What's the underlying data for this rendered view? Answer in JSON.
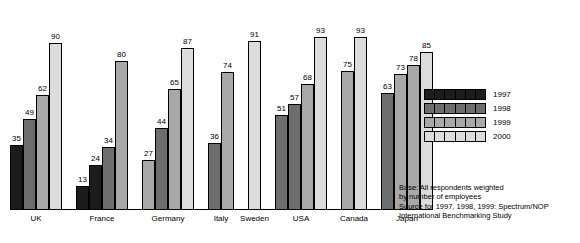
{
  "chart_data": {
    "type": "bar",
    "title": "",
    "xlabel": "",
    "ylabel": "",
    "ylim": [
      0,
      100
    ],
    "grid": false,
    "legend_position": "right",
    "categories": [
      "UK",
      "France",
      "Germany",
      "Italy",
      "Sweden",
      "USA",
      "Canada",
      "Japan"
    ],
    "series": [
      {
        "name": "1997",
        "color": "#1c1c1c",
        "values": [
          35,
          13,
          null,
          null,
          null,
          51,
          null,
          null
        ]
      },
      {
        "name": "1998",
        "color": "#6e6e6e",
        "values": [
          49,
          24,
          27,
          null,
          null,
          57,
          null,
          63
        ]
      },
      {
        "name": "1999",
        "color": "#a8a8a8",
        "values": [
          62,
          34,
          44,
          36,
          null,
          68,
          75,
          73
        ]
      },
      {
        "name": "2000",
        "color": "#dcdcdc",
        "values": [
          90,
          80,
          65,
          74,
          91,
          93,
          93,
          78
        ]
      }
    ],
    "groups": [
      {
        "label": "UK",
        "bars": [
          {
            "year": "1997",
            "value": 35,
            "shade": "y1997"
          },
          {
            "year": "1998",
            "value": 49,
            "shade": "y1998"
          },
          {
            "year": "1999",
            "value": 62,
            "shade": "y1999"
          },
          {
            "year": "2000",
            "value": 90,
            "shade": "y2000"
          }
        ]
      },
      {
        "label": "France",
        "bars": [
          {
            "year": "1997",
            "value": 13,
            "shade": "y1997"
          },
          {
            "year": "1998",
            "value": 24,
            "shade": "y1997"
          },
          {
            "year": "1999",
            "value": 34,
            "shade": "y1998"
          },
          {
            "year": "2000",
            "value": 80,
            "shade": "y1999"
          }
        ]
      },
      {
        "label": "Germany",
        "bars": [
          {
            "year": "1998",
            "value": 27,
            "shade": "y1999"
          },
          {
            "year": "1999",
            "value": 44,
            "shade": "y1998"
          },
          {
            "year": "2000",
            "value": 65,
            "shade": "y1999"
          },
          {
            "year": "2000",
            "value": 87,
            "shade": "y2000"
          }
        ]
      },
      {
        "label": "Italy",
        "bars": [
          {
            "year": "1999",
            "value": 36,
            "shade": "y1998"
          },
          {
            "year": "2000",
            "value": 74,
            "shade": "y1999"
          }
        ]
      },
      {
        "label": "Sweden",
        "bars": [
          {
            "year": "2000",
            "value": 91,
            "shade": "y2000"
          }
        ]
      },
      {
        "label": "USA",
        "bars": [
          {
            "year": "1997",
            "value": 51,
            "shade": "y1998"
          },
          {
            "year": "1998",
            "value": 57,
            "shade": "y1998"
          },
          {
            "year": "1999",
            "value": 68,
            "shade": "y1999"
          },
          {
            "year": "2000",
            "value": 93,
            "shade": "y2000"
          }
        ]
      },
      {
        "label": "Canada",
        "bars": [
          {
            "year": "1999",
            "value": 75,
            "shade": "y1999"
          },
          {
            "year": "2000",
            "value": 93,
            "shade": "y2000"
          }
        ]
      },
      {
        "label": "Japan",
        "bars": [
          {
            "year": "1998",
            "value": 63,
            "shade": "y1998"
          },
          {
            "year": "1999",
            "value": 73,
            "shade": "y1999"
          },
          {
            "year": "2000",
            "value": 78,
            "shade": "y1999"
          },
          {
            "year": "2000",
            "value": 85,
            "shade": "y2000"
          }
        ]
      }
    ]
  },
  "legend": {
    "items": [
      {
        "label": "1997",
        "shade": "y1997"
      },
      {
        "label": "1998",
        "shade": "y1998"
      },
      {
        "label": "1999",
        "shade": "y1999"
      },
      {
        "label": "2000",
        "shade": "y2000"
      }
    ]
  },
  "footnote": {
    "line1": "Base: All respondents weighted",
    "line2": "by number of employees",
    "line3": "Source for 1997, 1998, 1999: Spectrum/NOP",
    "line4": "International Benchmarking Study"
  }
}
